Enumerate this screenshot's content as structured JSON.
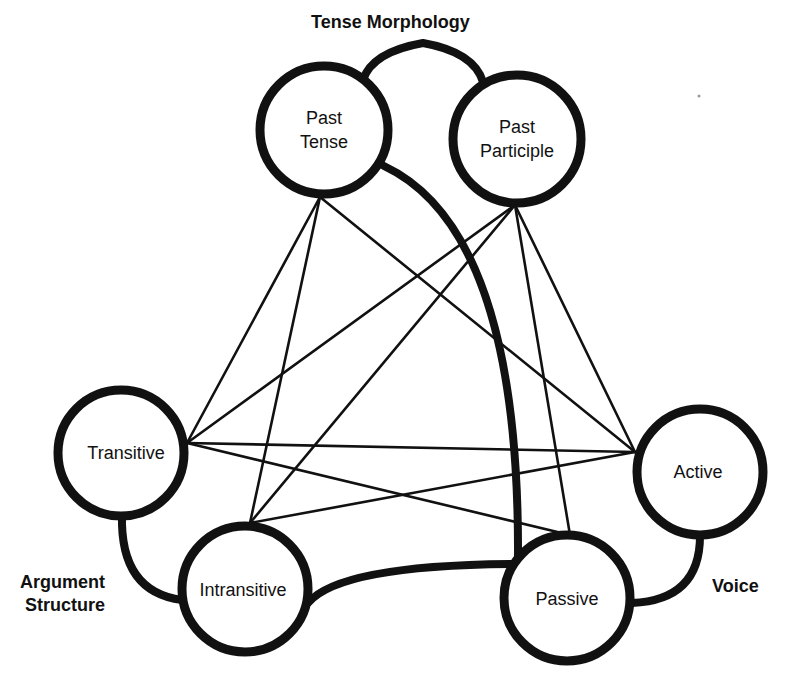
{
  "diagram": {
    "type": "network",
    "groups": {
      "tense": {
        "label": "Tense Morphology"
      },
      "argument": {
        "label_line1": "Argument",
        "label_line2": "Structure"
      },
      "voice": {
        "label": "Voice"
      }
    },
    "nodes": {
      "past_tense": {
        "line1": "Past",
        "line2": "Tense",
        "group": "tense"
      },
      "past_participle": {
        "line1": "Past",
        "line2": "Participle",
        "group": "tense"
      },
      "transitive": {
        "label": "Transitive",
        "group": "argument"
      },
      "intransitive": {
        "label": "Intransitive",
        "group": "argument"
      },
      "active": {
        "label": "Active",
        "group": "voice"
      },
      "passive": {
        "label": "Passive",
        "group": "voice"
      }
    },
    "thin_edges": [
      [
        "past_tense",
        "transitive"
      ],
      [
        "past_tense",
        "intransitive"
      ],
      [
        "past_tense",
        "active"
      ],
      [
        "past_participle",
        "transitive"
      ],
      [
        "past_participle",
        "intransitive"
      ],
      [
        "past_participle",
        "active"
      ],
      [
        "past_participle",
        "passive"
      ],
      [
        "transitive",
        "active"
      ],
      [
        "transitive",
        "passive"
      ],
      [
        "intransitive",
        "active"
      ]
    ],
    "thick_edges": [
      [
        "past_tense",
        "past_participle"
      ],
      [
        "transitive",
        "intransitive"
      ],
      [
        "active",
        "passive"
      ],
      [
        "past_tense",
        "passive"
      ],
      [
        "intransitive",
        "passive"
      ]
    ],
    "colors": {
      "stroke": "#111111",
      "background": "#ffffff"
    }
  }
}
